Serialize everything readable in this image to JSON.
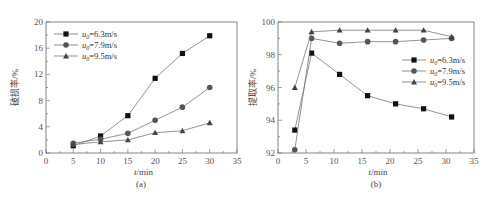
{
  "chart_data": [
    {
      "type": "line",
      "panel_label": "(a)",
      "title": "",
      "xlabel": "t/min",
      "ylabel": "破损率/%",
      "xlim": [
        0,
        35
      ],
      "ylim": [
        0,
        20
      ],
      "xticks": [
        0,
        5,
        10,
        15,
        20,
        25,
        30,
        35
      ],
      "yticks": [
        0,
        4,
        8,
        12,
        16,
        20
      ],
      "grid": false,
      "legend_position": "upper left",
      "series": [
        {
          "name": "u0=6.3m/s",
          "marker": "square",
          "x": [
            5,
            10,
            15,
            20,
            25,
            30
          ],
          "values": [
            1.1,
            2.6,
            5.7,
            11.4,
            15.2,
            17.9
          ]
        },
        {
          "name": "u0=7.9m/s",
          "marker": "circle",
          "x": [
            5,
            10,
            15,
            20,
            25,
            30
          ],
          "values": [
            1.5,
            2.1,
            3.0,
            5.0,
            7.0,
            10.0
          ]
        },
        {
          "name": "u0=9.5m/s",
          "marker": "triangle",
          "x": [
            5,
            10,
            15,
            20,
            25,
            30
          ],
          "values": [
            1.3,
            1.7,
            2.0,
            3.1,
            3.4,
            4.6
          ]
        }
      ]
    },
    {
      "type": "line",
      "panel_label": "(b)",
      "title": "",
      "xlabel": "t/min",
      "ylabel": "提取率/%",
      "xlim": [
        0,
        35
      ],
      "ylim": [
        92,
        100
      ],
      "xticks": [
        0,
        5,
        10,
        15,
        20,
        25,
        30,
        35
      ],
      "yticks": [
        92,
        94,
        96,
        98,
        100
      ],
      "grid": false,
      "legend_position": "center right",
      "series": [
        {
          "name": "u0=6.3m/s",
          "marker": "square",
          "x": [
            3,
            6,
            11,
            16,
            21,
            26,
            31
          ],
          "values": [
            93.4,
            98.1,
            96.8,
            95.5,
            95.0,
            94.7,
            94.2
          ]
        },
        {
          "name": "u0=7.9m/s",
          "marker": "circle",
          "x": [
            3,
            6,
            11,
            16,
            21,
            26,
            31
          ],
          "values": [
            92.2,
            99.0,
            98.7,
            98.8,
            98.8,
            98.9,
            99.0
          ]
        },
        {
          "name": "u0=9.5m/s",
          "marker": "triangle",
          "x": [
            3,
            6,
            11,
            16,
            21,
            26,
            31
          ],
          "values": [
            96.0,
            99.4,
            99.5,
            99.5,
            99.5,
            99.5,
            99.1
          ]
        }
      ]
    }
  ],
  "legend": {
    "items": [
      {
        "prefix": "u",
        "sub": "0",
        "suffix": "=6.3m/s"
      },
      {
        "prefix": "u",
        "sub": "0",
        "suffix": "=7.9m/s"
      },
      {
        "prefix": "u",
        "sub": "0",
        "suffix": "=9.5m/s"
      }
    ]
  }
}
